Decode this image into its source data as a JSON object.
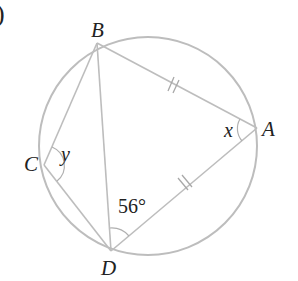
{
  "part_marker": ")",
  "figure": {
    "type": "cyclic quadrilateral in circle",
    "circle": {
      "cx": 147,
      "cy": 146,
      "r": 109
    },
    "points": {
      "A": {
        "label": "A",
        "x": 257,
        "y": 128
      },
      "B": {
        "label": "B",
        "x": 97,
        "y": 43
      },
      "C": {
        "label": "C",
        "x": 44,
        "y": 165
      },
      "D": {
        "label": "D",
        "x": 111,
        "y": 251
      }
    },
    "segments": [
      "AB",
      "BC",
      "CD",
      "DA",
      "BD"
    ],
    "equal_marks": {
      "segments": [
        "BA",
        "DA"
      ],
      "mark": "double tick"
    },
    "angles": {
      "x": {
        "label": "x",
        "vertex": "A"
      },
      "y": {
        "label": "y",
        "vertex": "C"
      },
      "BDA": {
        "label": "56°",
        "vertex": "D"
      }
    }
  },
  "colors": {
    "lines": "#bdbdbd",
    "text": "#222222"
  }
}
